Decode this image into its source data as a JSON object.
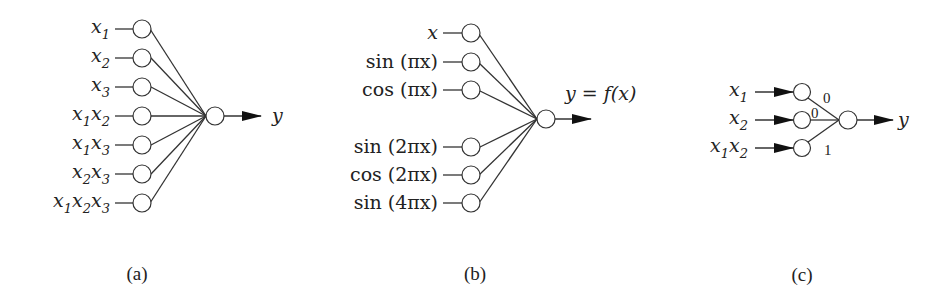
{
  "figure": {
    "panels": [
      {
        "id": "a",
        "caption": "(a)",
        "inputs": [
          {
            "parts": [
              {
                "t": "x",
                "s": "1"
              }
            ]
          },
          {
            "parts": [
              {
                "t": "x",
                "s": "2"
              }
            ]
          },
          {
            "parts": [
              {
                "t": "x",
                "s": "3"
              }
            ]
          },
          {
            "parts": [
              {
                "t": "x",
                "s": "1"
              },
              {
                "t": "x",
                "s": "2"
              }
            ]
          },
          {
            "parts": [
              {
                "t": "x",
                "s": "1"
              },
              {
                "t": "x",
                "s": "3"
              }
            ]
          },
          {
            "parts": [
              {
                "t": "x",
                "s": "2"
              },
              {
                "t": "x",
                "s": "3"
              }
            ]
          },
          {
            "parts": [
              {
                "t": "x",
                "s": "1"
              },
              {
                "t": "x",
                "s": "2"
              },
              {
                "t": "x",
                "s": "3"
              }
            ]
          }
        ],
        "input_labels_text": [
          "x1",
          "x2",
          "x3",
          "x1x2",
          "x1x3",
          "x2x3",
          "x1x2x3"
        ],
        "output_label": "y"
      },
      {
        "id": "b",
        "caption": "(b)",
        "input_labels_text": [
          "x",
          "sin (πx)",
          "cos (πx)",
          "sin (2πx)",
          "cos (2πx)",
          "sin (4πx)"
        ],
        "output_label": "y = f(x)"
      },
      {
        "id": "c",
        "caption": "(c)",
        "input_labels_text": [
          "x1",
          "x2",
          "x1x2"
        ],
        "weights": [
          "0",
          "0",
          "1"
        ],
        "output_label": "y"
      }
    ]
  }
}
